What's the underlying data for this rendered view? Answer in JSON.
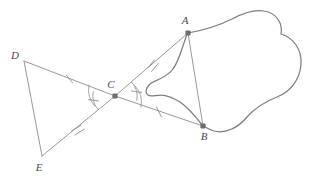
{
  "figure": {
    "background_color": "#ffffff",
    "line_color": "#8c8c8c",
    "curve_color": "#7d7d7d",
    "vertex_color": "#6e6e6e",
    "label_color": "#4a4a4a"
  },
  "points": [
    {
      "id": "A",
      "label": "A",
      "x": 188,
      "y": 33,
      "label_x": 185,
      "label_y": 24,
      "marked": true
    },
    {
      "id": "B",
      "label": "B",
      "x": 203,
      "y": 126,
      "label_x": 204,
      "label_y": 140,
      "marked": true
    },
    {
      "id": "C",
      "label": "C",
      "x": 115,
      "y": 96,
      "label_x": 111,
      "label_y": 88,
      "marked": true
    },
    {
      "id": "D",
      "label": "D",
      "x": 24,
      "y": 61,
      "label_x": 15,
      "label_y": 59,
      "marked": false
    },
    {
      "id": "E",
      "label": "E",
      "x": 42,
      "y": 156,
      "label_x": 39,
      "label_y": 171,
      "marked": false
    }
  ],
  "segments": [
    {
      "id": "DC",
      "from": "D",
      "to": "C",
      "ticks": 1
    },
    {
      "id": "CA",
      "from": "C",
      "to": "A",
      "ticks": 2
    },
    {
      "id": "EC",
      "from": "E",
      "to": "C",
      "ticks": 2
    },
    {
      "id": "CB",
      "from": "C",
      "to": "B",
      "ticks": 1
    },
    {
      "id": "DE",
      "from": "D",
      "to": "E",
      "ticks": 0
    },
    {
      "id": "AB",
      "from": "A",
      "to": "B",
      "ticks": 0
    }
  ],
  "angle_marks": [
    {
      "id": "angle-DCE",
      "at": "C",
      "arcs": 2,
      "tick": true,
      "side": "left"
    },
    {
      "id": "angle-ACB",
      "at": "C",
      "arcs": 2,
      "tick": true,
      "side": "right"
    }
  ],
  "blob": {
    "id": "irregular-region",
    "description": "irregular closed curve through A and B",
    "path": "M 188 33 C 205 30 218 26 232 19 C 243 13 253 9 264 11 C 277 13 283 24 281 34 C 294 38 302 50 301 64 C 300 80 290 92 277 97 C 264 102 255 108 247 117 C 238 128 225 134 214 131 C 208 129 205 127 203 126 C 196 117 189 108 180 102 C 172 97 166 95 161 95 C 155 95 151 97 148 95 C 144 92 147 85 153 82 C 160 79 168 76 173 69 C 179 61 182 48 185 40 C 186 36 187 34 188 33 Z"
  },
  "tick_marks": {
    "length": 7,
    "spacing": 3
  }
}
